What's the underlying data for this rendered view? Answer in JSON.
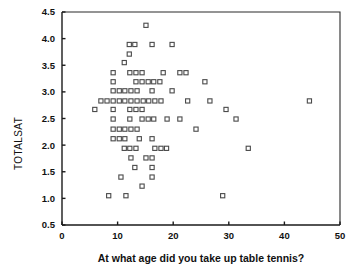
{
  "chart_data": {
    "type": "scatter",
    "title": "",
    "subtitle": "",
    "xlabel": "At what age did you take up table tennis?",
    "ylabel": "TOTALSAT",
    "xlim": [
      0,
      50
    ],
    "ylim": [
      0.5,
      4.5
    ],
    "xticks": [
      0,
      10,
      20,
      30,
      40,
      50
    ],
    "xtick_labels": [
      "0",
      "10",
      "20",
      "30",
      "40",
      "50"
    ],
    "yticks": [
      0.5,
      1.0,
      1.5,
      2.0,
      2.5,
      3.0,
      3.5,
      4.0,
      4.5
    ],
    "ytick_labels": [
      "0.5",
      "1.0",
      "1.5",
      "2.0",
      "2.5",
      "3.0",
      "3.5",
      "4.0",
      "4.5"
    ],
    "grid": false,
    "legend": null,
    "marker_style": "open-square",
    "marker_color": "#4a4a4a",
    "points": [
      {
        "x": 15.1,
        "y": 4.25
      },
      {
        "x": 12.1,
        "y": 3.89
      },
      {
        "x": 13.1,
        "y": 3.89
      },
      {
        "x": 16.2,
        "y": 3.89
      },
      {
        "x": 19.8,
        "y": 3.89
      },
      {
        "x": 12.1,
        "y": 3.71
      },
      {
        "x": 11.2,
        "y": 3.55
      },
      {
        "x": 9.2,
        "y": 3.36
      },
      {
        "x": 12.2,
        "y": 3.36
      },
      {
        "x": 13.3,
        "y": 3.36
      },
      {
        "x": 14.4,
        "y": 3.36
      },
      {
        "x": 18.2,
        "y": 3.36
      },
      {
        "x": 21.2,
        "y": 3.36
      },
      {
        "x": 22.3,
        "y": 3.36
      },
      {
        "x": 9.2,
        "y": 3.19
      },
      {
        "x": 13.3,
        "y": 3.19
      },
      {
        "x": 14.4,
        "y": 3.19
      },
      {
        "x": 15.5,
        "y": 3.19
      },
      {
        "x": 16.5,
        "y": 3.19
      },
      {
        "x": 17.6,
        "y": 3.19
      },
      {
        "x": 25.7,
        "y": 3.19
      },
      {
        "x": 9.2,
        "y": 3.02
      },
      {
        "x": 10.3,
        "y": 3.02
      },
      {
        "x": 11.3,
        "y": 3.02
      },
      {
        "x": 12.4,
        "y": 3.02
      },
      {
        "x": 13.5,
        "y": 3.02
      },
      {
        "x": 16.2,
        "y": 3.02
      },
      {
        "x": 19.8,
        "y": 3.02
      },
      {
        "x": 7.0,
        "y": 2.83
      },
      {
        "x": 8.1,
        "y": 2.83
      },
      {
        "x": 9.2,
        "y": 2.83
      },
      {
        "x": 10.3,
        "y": 2.83
      },
      {
        "x": 11.3,
        "y": 2.83
      },
      {
        "x": 12.4,
        "y": 2.83
      },
      {
        "x": 13.5,
        "y": 2.83
      },
      {
        "x": 14.6,
        "y": 2.83
      },
      {
        "x": 15.6,
        "y": 2.83
      },
      {
        "x": 16.7,
        "y": 2.83
      },
      {
        "x": 17.8,
        "y": 2.83
      },
      {
        "x": 22.6,
        "y": 2.83
      },
      {
        "x": 26.6,
        "y": 2.83
      },
      {
        "x": 44.5,
        "y": 2.83
      },
      {
        "x": 5.9,
        "y": 2.67
      },
      {
        "x": 9.2,
        "y": 2.67
      },
      {
        "x": 12.2,
        "y": 2.67
      },
      {
        "x": 13.3,
        "y": 2.67
      },
      {
        "x": 14.4,
        "y": 2.67
      },
      {
        "x": 29.5,
        "y": 2.67
      },
      {
        "x": 9.2,
        "y": 2.49
      },
      {
        "x": 12.2,
        "y": 2.49
      },
      {
        "x": 14.4,
        "y": 2.49
      },
      {
        "x": 15.5,
        "y": 2.49
      },
      {
        "x": 16.5,
        "y": 2.49
      },
      {
        "x": 18.9,
        "y": 2.49
      },
      {
        "x": 21.2,
        "y": 2.49
      },
      {
        "x": 31.3,
        "y": 2.49
      },
      {
        "x": 9.2,
        "y": 2.3
      },
      {
        "x": 10.3,
        "y": 2.3
      },
      {
        "x": 11.3,
        "y": 2.3
      },
      {
        "x": 12.4,
        "y": 2.3
      },
      {
        "x": 13.5,
        "y": 2.3
      },
      {
        "x": 24.1,
        "y": 2.3
      },
      {
        "x": 9.2,
        "y": 2.12
      },
      {
        "x": 10.3,
        "y": 2.12
      },
      {
        "x": 11.3,
        "y": 2.12
      },
      {
        "x": 13.9,
        "y": 2.12
      },
      {
        "x": 16.2,
        "y": 2.12
      },
      {
        "x": 11.2,
        "y": 1.94
      },
      {
        "x": 12.2,
        "y": 1.94
      },
      {
        "x": 13.3,
        "y": 1.94
      },
      {
        "x": 16.7,
        "y": 1.94
      },
      {
        "x": 17.8,
        "y": 1.94
      },
      {
        "x": 18.8,
        "y": 1.94
      },
      {
        "x": 33.5,
        "y": 1.94
      },
      {
        "x": 12.4,
        "y": 1.76
      },
      {
        "x": 15.1,
        "y": 1.76
      },
      {
        "x": 16.2,
        "y": 1.76
      },
      {
        "x": 13.1,
        "y": 1.58
      },
      {
        "x": 16.2,
        "y": 1.58
      },
      {
        "x": 10.6,
        "y": 1.4
      },
      {
        "x": 16.2,
        "y": 1.4
      },
      {
        "x": 14.4,
        "y": 1.23
      },
      {
        "x": 8.4,
        "y": 1.05
      },
      {
        "x": 11.5,
        "y": 1.05
      },
      {
        "x": 28.9,
        "y": 1.05
      }
    ]
  }
}
